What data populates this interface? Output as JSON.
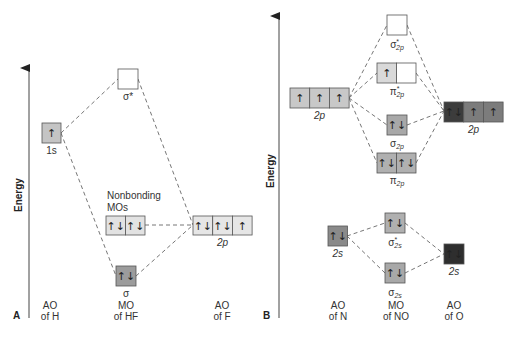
{
  "panels": {
    "A": {
      "letter": "A",
      "axis_label": "Energy",
      "columns": {
        "left": [
          "AO",
          "of H"
        ],
        "middle": [
          "MO",
          "of HF"
        ],
        "right": [
          "AO",
          "of F"
        ]
      },
      "orbitals": {
        "h_1s": {
          "label": "1s",
          "electrons": [
            "↑"
          ],
          "fill": "#c4c4c4"
        },
        "sigma_star": {
          "label": "σ*",
          "electrons": [
            ""
          ],
          "fill": "#ffffff"
        },
        "nonbonding": {
          "label_line1": "Nonbonding",
          "label_line2": "MOs",
          "electrons": [
            "↑↓",
            "↑↓"
          ],
          "fill": "#e2e2e2"
        },
        "f_2p": {
          "label": "2p",
          "electrons": [
            "↑↓",
            "↑↓",
            "↑"
          ],
          "fill": "#e6e6e6"
        },
        "sigma": {
          "label": "σ",
          "electrons": [
            "↑↓"
          ],
          "fill": "#9c9c9c"
        }
      }
    },
    "B": {
      "letter": "B",
      "axis_label": "Energy",
      "columns": {
        "left": [
          "AO",
          "of N"
        ],
        "middle": [
          "MO",
          "of NO"
        ],
        "right": [
          "AO",
          "of O"
        ]
      },
      "orbitals": {
        "sigma_star_2p": {
          "label": "σ",
          "sup": "*",
          "sub": "2p",
          "electrons": [
            ""
          ],
          "fill": "#ffffff"
        },
        "pi_star_2p": {
          "label": "π",
          "sup": "*",
          "sub": "2p",
          "electrons": [
            "↑",
            ""
          ],
          "fills": [
            "#d9d9d9",
            "#ffffff"
          ]
        },
        "n_2p": {
          "label": "2p",
          "electrons": [
            "↑",
            "↑",
            "↑"
          ],
          "fill": "#c8c8c8"
        },
        "o_2p": {
          "label": "2p",
          "electrons": [
            "↑↓",
            "↑",
            "↑"
          ],
          "fills": [
            "#3c3c3c",
            "#7c7c7c",
            "#7c7c7c"
          ]
        },
        "sigma_2p": {
          "label": "σ",
          "sub": "2p",
          "electrons": [
            "↑↓"
          ],
          "fill": "#a8a8a8"
        },
        "pi_2p": {
          "label": "π",
          "sub": "2p",
          "electrons": [
            "↑↓",
            "↑↓"
          ],
          "fill": "#b0b0b0"
        },
        "n_2s": {
          "label": "2s",
          "electrons": [
            "↑↓"
          ],
          "fill": "#8a8a8a"
        },
        "sigma_star_2s": {
          "label": "σ",
          "sup": "*",
          "sub": "2s",
          "electrons": [
            "↑↓"
          ],
          "fill": "#b0b0b0"
        },
        "o_2s": {
          "label": "2s",
          "electrons": [
            "↑↓"
          ],
          "fill": "#2e2e2e"
        },
        "sigma_2s": {
          "label": "σ",
          "sub": "2s",
          "electrons": [
            "↑↓"
          ],
          "fill": "#a8a8a8"
        }
      }
    }
  }
}
